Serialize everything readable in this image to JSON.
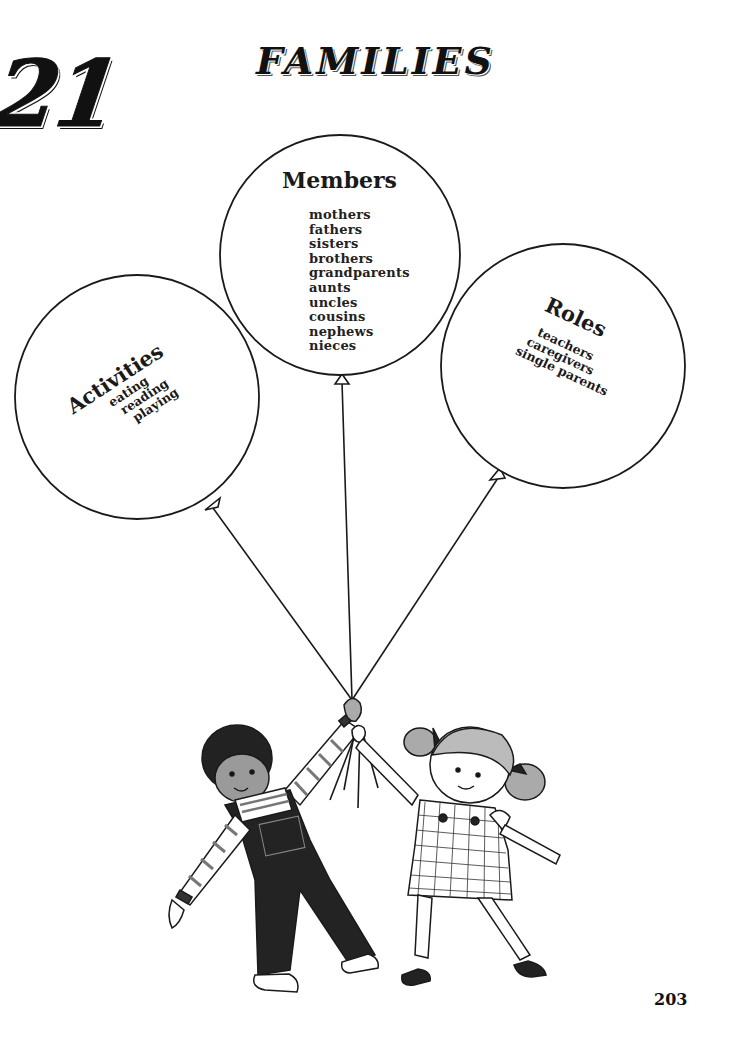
{
  "page": {
    "chapter_number": "21",
    "title": "FAMILIES",
    "page_number": "203"
  },
  "balloons": {
    "members": {
      "heading": "Members",
      "items": [
        "mothers",
        "fathers",
        "sisters",
        "brothers",
        "grandparents",
        "aunts",
        "uncles",
        "cousins",
        "nephews",
        "nieces"
      ]
    },
    "activities": {
      "heading": "Activities",
      "items": [
        "eating",
        "reading",
        "playing"
      ]
    },
    "roles": {
      "heading": "Roles",
      "items": [
        "teachers",
        "caregivers",
        "single parents"
      ]
    }
  },
  "illustration": {
    "description": "Boy in striped shirt and overalls and girl in checked pinafore dress holding balloon strings together",
    "colors": {
      "ink": "#1a1a1a",
      "paper": "#ffffff",
      "shade": "#9a9a9a"
    }
  }
}
